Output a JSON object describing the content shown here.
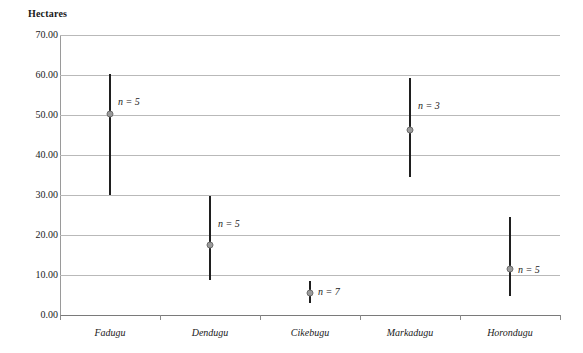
{
  "chart_data": {
    "type": "scatter",
    "title": "",
    "subtitle": "",
    "xlabel": "",
    "ylabel": "Hectares",
    "ylim": [
      0,
      70
    ],
    "ytick_step": 10,
    "ytick_labels": [
      "0.00",
      "10.00",
      "20.00",
      "30.00",
      "40.00",
      "50.00",
      "60.00",
      "70.00"
    ],
    "ytick_values": [
      0,
      10,
      20,
      30,
      40,
      50,
      60,
      70
    ],
    "grid": "horizontal",
    "legend": "none",
    "categories": [
      "Fadugu",
      "Dendugu",
      "Cikebugu",
      "Markadugu",
      "Horondugu"
    ],
    "series": [
      {
        "name": "range",
        "description": "vertical min-max range line per village",
        "min": [
          30.0,
          8.8,
          3.0,
          34.5,
          4.8
        ],
        "max": [
          60.3,
          29.8,
          8.5,
          59.3,
          24.5
        ]
      },
      {
        "name": "mean",
        "description": "gray circle marker at mean hectares",
        "values": [
          50.3,
          17.5,
          5.5,
          46.3,
          11.5
        ]
      }
    ],
    "annotations": [
      {
        "category": "Fadugu",
        "text": "n = 5",
        "at_value": 53.5
      },
      {
        "category": "Dendugu",
        "text": "n = 5",
        "at_value": 23.0
      },
      {
        "category": "Cikebugu",
        "text": "n = 7",
        "at_value": 6.0
      },
      {
        "category": "Markadugu",
        "text": "n = 3",
        "at_value": 52.5
      },
      {
        "category": "Horondugu",
        "text": "n = 5",
        "at_value": 11.5
      }
    ],
    "colors": {
      "range_line": "#1f1f1f",
      "mean_marker_fill": "#9b9b9b",
      "mean_marker_stroke": "#6e6e6e",
      "grid": "#b9b9b9",
      "axis": "#8a8a8a",
      "text": "#1a1a1a",
      "background": "#ffffff"
    }
  }
}
